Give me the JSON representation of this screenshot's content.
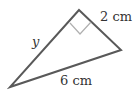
{
  "diagram": {
    "type": "right-triangle",
    "labels": {
      "hypotenuse_side": "y",
      "short_leg": "2 cm",
      "base": "6 cm"
    },
    "right_angle_marker": true,
    "colors": {
      "stroke": "#595959",
      "marker": "#b0b0b0",
      "text": "#333333"
    }
  }
}
